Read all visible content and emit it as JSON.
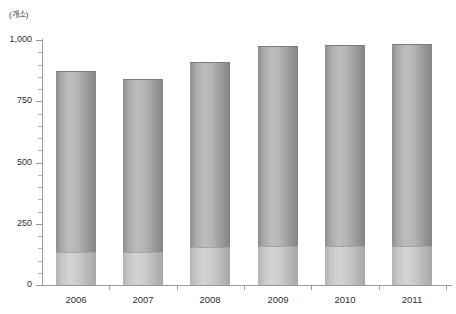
{
  "chart_data": {
    "type": "bar",
    "title": "",
    "subtitle": "",
    "unit_label": "(개소)",
    "xlabel": "",
    "ylabel": "",
    "categories": [
      "2006",
      "2007",
      "2008",
      "2009",
      "2010",
      "2011"
    ],
    "values": [
      875,
      840,
      910,
      975,
      978,
      985
    ],
    "series": [
      {
        "name": "lower-segment",
        "values": [
          135,
          135,
          155,
          160,
          158,
          160
        ]
      },
      {
        "name": "upper-segment",
        "values": [
          740,
          705,
          755,
          815,
          820,
          825
        ]
      }
    ],
    "stacked": true,
    "ylim": [
      0,
      1000
    ],
    "ytick_values": [
      0,
      250,
      500,
      750,
      1000
    ],
    "ytick_labels": [
      "0",
      "250",
      "500",
      "750",
      "1,000"
    ],
    "yminor_step": 50,
    "grid": false,
    "legend": "none",
    "colors": {
      "bar_upper": "#a9a9a9",
      "bar_lower": "#c9c9c9",
      "axis": "#9a9a9a",
      "text": "#2f2f2f",
      "background": "#ffffff"
    }
  }
}
